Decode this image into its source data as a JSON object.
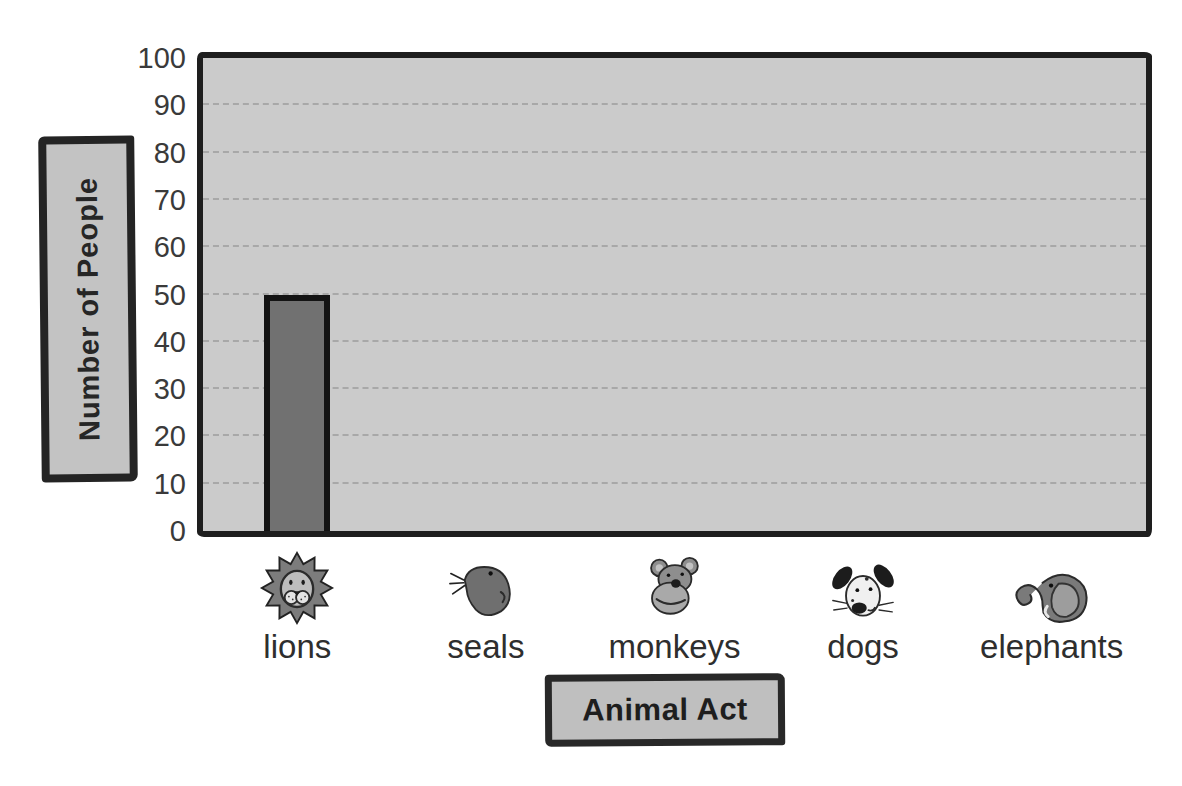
{
  "chart_data": {
    "type": "bar",
    "title": "",
    "xlabel": "Animal Act",
    "ylabel": "Number of People",
    "categories": [
      "lions",
      "seals",
      "monkeys",
      "dogs",
      "elephants"
    ],
    "values": [
      50,
      null,
      null,
      null,
      null
    ],
    "series": [
      {
        "name": "Number of People",
        "values": [
          50,
          null,
          null,
          null,
          null
        ]
      }
    ],
    "ylim": [
      0,
      100
    ],
    "ytick_step": 10,
    "yticks": [
      100,
      90,
      80,
      70,
      60,
      50,
      40,
      30,
      20,
      10,
      0
    ],
    "grid": "horizontal-dashed",
    "legend": "none",
    "category_icons": [
      "lion-icon",
      "seal-icon",
      "monkey-icon",
      "dog-icon",
      "elephant-icon"
    ],
    "colors": {
      "page_background": "#ffffff",
      "plot_background": "#cbcbcb",
      "bar_fill": "#717171",
      "bar_border": "#131313",
      "gridline": "#a2a2a2",
      "frame_border": "#1e1e1e",
      "label_box_fill": "#c3c3c3",
      "label_box_border": "#242424",
      "text": "#2e2e2e"
    }
  }
}
